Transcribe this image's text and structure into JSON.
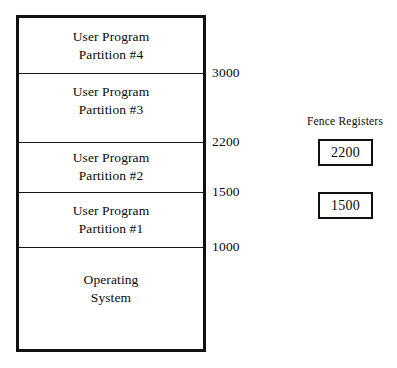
{
  "diagram": {
    "background_color": "#ffffff",
    "line_color": "#111111"
  },
  "memory_map": {
    "bands": [
      {
        "label": "User Program\nPartition #4",
        "top": 0,
        "height": 55,
        "align": "centered"
      },
      {
        "label": "User Program\nPartition #3",
        "top": 55,
        "height": 69,
        "align": "top-aligned"
      },
      {
        "label": "User Program\nPartition #2",
        "top": 124,
        "height": 50,
        "align": "centered"
      },
      {
        "label": "User Program\nPartition #1",
        "top": 174,
        "height": 55,
        "align": "centered"
      },
      {
        "label": "Operating\nSystem",
        "top": 229,
        "height": 105,
        "align": "top-aligned"
      }
    ],
    "dividers": [
      {
        "address": "3000",
        "y": 55
      },
      {
        "address": "2200",
        "y": 124
      },
      {
        "address": "1500",
        "y": 174
      },
      {
        "address": "1000",
        "y": 229
      }
    ]
  },
  "address_labels": [
    {
      "value": "3000",
      "x": 212,
      "y": 66
    },
    {
      "value": "2200",
      "x": 212,
      "y": 135
    },
    {
      "value": "1500",
      "x": 212,
      "y": 185
    },
    {
      "value": "1000",
      "x": 212,
      "y": 240
    }
  ],
  "fence_registers": {
    "title": "Fence Registers",
    "boxes": [
      {
        "value": "2200",
        "left": 23,
        "top": 23
      },
      {
        "value": "1500",
        "left": 23,
        "top": 76
      }
    ]
  }
}
